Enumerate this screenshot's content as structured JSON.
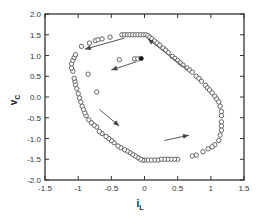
{
  "chart_data": {
    "type": "scatter",
    "title": "",
    "xlabel": "i",
    "xlabel_subscript": "L",
    "ylabel": "v",
    "ylabel_subscript": "C",
    "xlim": [
      -1.5,
      1.5
    ],
    "ylim": [
      -2.0,
      2.0
    ],
    "grid": false,
    "legend": null,
    "x_ticks": [
      -1.5,
      -1,
      -0.5,
      0,
      0.5,
      1,
      1.5
    ],
    "x_tick_labels": [
      "-1.5",
      "-1",
      "-0.5",
      "0",
      "0.5",
      "1",
      "1.5"
    ],
    "y_ticks": [
      2.0,
      1.5,
      1.0,
      0.5,
      0.0,
      -0.5,
      -1.0,
      -1.5,
      -2.0
    ],
    "y_tick_labels": [
      "2.0",
      "1.5",
      "1.0",
      "0.5",
      "0.0",
      "-0.5",
      "-1.0",
      "-1.5",
      "-2.0"
    ],
    "series": [
      {
        "name": "trajectory (open circles)",
        "marker": "open-circle",
        "points": [
          [
            -0.95,
            1.22
          ],
          [
            -0.83,
            1.3
          ],
          [
            -0.74,
            1.36
          ],
          [
            -0.7,
            1.38
          ],
          [
            -0.64,
            1.4
          ],
          [
            -0.52,
            1.44
          ],
          [
            -0.34,
            1.5
          ],
          [
            -0.3,
            1.5
          ],
          [
            -0.26,
            1.5
          ],
          [
            -0.22,
            1.5
          ],
          [
            -0.18,
            1.5
          ],
          [
            -0.14,
            1.5
          ],
          [
            -0.1,
            1.5
          ],
          [
            -0.06,
            1.5
          ],
          [
            -0.02,
            1.5
          ],
          [
            0.02,
            1.5
          ],
          [
            0.05,
            1.48
          ],
          [
            0.08,
            1.44
          ],
          [
            0.11,
            1.4
          ],
          [
            0.15,
            1.35
          ],
          [
            0.19,
            1.3
          ],
          [
            0.23,
            1.25
          ],
          [
            0.28,
            1.18
          ],
          [
            0.32,
            1.13
          ],
          [
            0.36,
            1.07
          ],
          [
            0.42,
            0.98
          ],
          [
            0.46,
            0.93
          ],
          [
            0.5,
            0.88
          ],
          [
            0.54,
            0.82
          ],
          [
            0.58,
            0.77
          ],
          [
            0.64,
            0.7
          ],
          [
            0.68,
            0.65
          ],
          [
            0.72,
            0.6
          ],
          [
            0.78,
            0.5
          ],
          [
            0.82,
            0.45
          ],
          [
            0.86,
            0.38
          ],
          [
            0.92,
            0.28
          ],
          [
            0.95,
            0.22
          ],
          [
            0.98,
            0.17
          ],
          [
            1.02,
            0.1
          ],
          [
            1.06,
            0.02
          ],
          [
            1.09,
            -0.05
          ],
          [
            1.12,
            -0.12
          ],
          [
            1.14,
            -0.22
          ],
          [
            1.16,
            -0.35
          ],
          [
            1.16,
            -0.45
          ],
          [
            1.16,
            -0.6
          ],
          [
            1.16,
            -0.7
          ],
          [
            1.16,
            -0.8
          ],
          [
            1.14,
            -0.92
          ],
          [
            1.12,
            -1.05
          ],
          [
            1.06,
            -1.15
          ],
          [
            1.02,
            -1.2
          ],
          [
            0.96,
            -1.25
          ],
          [
            0.88,
            -1.32
          ],
          [
            0.78,
            -1.4
          ],
          [
            0.72,
            -1.42
          ],
          [
            0.5,
            -1.5
          ],
          [
            0.45,
            -1.5
          ],
          [
            0.4,
            -1.5
          ],
          [
            0.35,
            -1.5
          ],
          [
            0.3,
            -1.5
          ],
          [
            0.25,
            -1.5
          ],
          [
            0.2,
            -1.52
          ],
          [
            0.15,
            -1.52
          ],
          [
            0.1,
            -1.52
          ],
          [
            0.05,
            -1.52
          ],
          [
            0.0,
            -1.52
          ],
          [
            -0.03,
            -1.52
          ],
          [
            -0.06,
            -1.5
          ],
          [
            -0.1,
            -1.46
          ],
          [
            -0.14,
            -1.42
          ],
          [
            -0.18,
            -1.38
          ],
          [
            -0.22,
            -1.34
          ],
          [
            -0.26,
            -1.3
          ],
          [
            -0.3,
            -1.27
          ],
          [
            -0.36,
            -1.22
          ],
          [
            -0.4,
            -1.18
          ],
          [
            -0.46,
            -1.1
          ],
          [
            -0.5,
            -1.05
          ],
          [
            -0.54,
            -1.0
          ],
          [
            -0.58,
            -0.95
          ],
          [
            -0.64,
            -0.88
          ],
          [
            -0.68,
            -0.83
          ],
          [
            -0.72,
            -0.72
          ],
          [
            -0.76,
            -0.68
          ],
          [
            -0.8,
            -0.62
          ],
          [
            -0.84,
            -0.55
          ],
          [
            -0.88,
            -0.45
          ],
          [
            -0.9,
            -0.38
          ],
          [
            -0.92,
            -0.3
          ],
          [
            -0.94,
            -0.22
          ],
          [
            -0.96,
            -0.12
          ],
          [
            -0.98,
            -0.02
          ],
          [
            -1.0,
            0.08
          ],
          [
            -1.02,
            0.2
          ],
          [
            -1.04,
            0.3
          ],
          [
            -1.05,
            0.38
          ],
          [
            -1.06,
            0.45
          ],
          [
            -1.08,
            0.62
          ],
          [
            -1.1,
            0.7
          ],
          [
            -1.1,
            0.8
          ],
          [
            -1.08,
            0.88
          ],
          [
            -1.06,
            0.95
          ],
          [
            -1.04,
            1.02
          ]
        ]
      },
      {
        "name": "transient points (open circles, interior)",
        "marker": "open-circle",
        "points": [
          [
            -0.38,
            0.9
          ],
          [
            -0.85,
            0.55
          ],
          [
            -0.72,
            0.12
          ],
          [
            -0.15,
            0.92
          ],
          [
            -0.1,
            0.92
          ]
        ]
      },
      {
        "name": "initial point (filled circle)",
        "marker": "filled-circle",
        "points": [
          [
            -0.05,
            0.93
          ]
        ]
      }
    ],
    "annotations": [
      {
        "type": "arrow",
        "from": [
          -0.3,
          1.42
        ],
        "to": [
          -0.9,
          1.15
        ],
        "label": ""
      },
      {
        "type": "arrow",
        "from": [
          -0.12,
          0.85
        ],
        "to": [
          -0.5,
          0.65
        ],
        "label": ""
      },
      {
        "type": "arrow",
        "from": [
          0.65,
          0.65
        ],
        "to": [
          0.05,
          1.4
        ],
        "label": ""
      },
      {
        "type": "arrow",
        "from": [
          -0.68,
          -0.3
        ],
        "to": [
          -0.38,
          -0.7
        ],
        "label": ""
      },
      {
        "type": "arrow",
        "from": [
          0.3,
          -1.05
        ],
        "to": [
          0.67,
          -0.92
        ],
        "label": ""
      }
    ]
  },
  "plot": {
    "frame_color": "#333333",
    "marker_stroke": "#444444",
    "arrow_color": "#444444"
  }
}
